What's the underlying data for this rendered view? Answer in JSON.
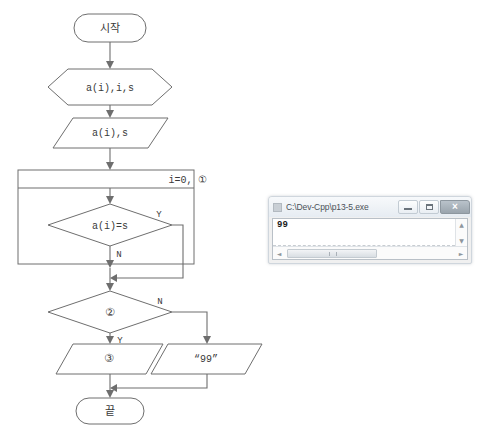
{
  "flowchart": {
    "title": "algorithm-flowchart",
    "nodes": {
      "start": "시작",
      "input_hex": "a(i),i,s",
      "input_para": "a(i),s",
      "loop_header": "i=0, ①",
      "decision_compare": "a(i)=s",
      "decision_two": "②",
      "output_three": "③",
      "output_99": "“99”",
      "end": "끝"
    },
    "branch_labels": {
      "compare_yes": "Y",
      "compare_no": "N",
      "two_yes": "Y",
      "two_no": "N"
    },
    "circled_numbers": {
      "one": "①",
      "two": "②",
      "three": "③"
    },
    "colors": {
      "stroke": "#6e6e6e",
      "fill": "#ffffff",
      "text": "#3a3a3a"
    }
  },
  "console_window": {
    "title": "C:\\Dev-Cpp\\p13-5.exe",
    "icon": "console-app-icon",
    "buttons": {
      "minimize": "minimize",
      "maximize": "maximize",
      "close": "×"
    },
    "output_text": "99",
    "scrollbars": {
      "v_up": "▲",
      "v_down": "▼",
      "h_left": "◄",
      "h_right": "►"
    }
  }
}
